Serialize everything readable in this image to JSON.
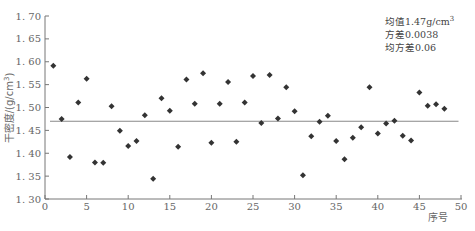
{
  "chart_data": {
    "type": "scatter",
    "title": "",
    "xlabel": "序号",
    "ylabel": "干密度/(g/cm³)",
    "xlim": [
      0,
      50
    ],
    "ylim": [
      1.3,
      1.7
    ],
    "x_ticks": [
      "0",
      "5",
      "10",
      "15",
      "20",
      "25",
      "30",
      "35",
      "40",
      "45",
      "50"
    ],
    "y_ticks": [
      "1.30",
      "1.35",
      "1.40",
      "1.45",
      "1.50",
      "1.55",
      "1.60",
      "1.65",
      "1.70"
    ],
    "grid": false,
    "marker": "diamond",
    "marker_color": "#333333",
    "mean_line": {
      "value": 1.47,
      "x_start": 0.6,
      "x_end": 49.7,
      "color": "#888888"
    },
    "annotations": [
      "均值1.47g/cm³",
      "方差0.0038",
      "均方差0.06"
    ],
    "series": [
      {
        "name": "干密度",
        "x": [
          1,
          2,
          3,
          4,
          5,
          6,
          7,
          8,
          9,
          10,
          11,
          12,
          13,
          14,
          15,
          16,
          17,
          18,
          19,
          20,
          21,
          22,
          23,
          24,
          25,
          26,
          27,
          28,
          29,
          30,
          31,
          32,
          33,
          34,
          35,
          36,
          37,
          38,
          39,
          40,
          41,
          42,
          43,
          44,
          45,
          46,
          47,
          48
        ],
        "values": [
          1.591,
          1.475,
          1.392,
          1.511,
          1.563,
          1.38,
          1.379,
          1.503,
          1.449,
          1.416,
          1.427,
          1.483,
          1.344,
          1.52,
          1.493,
          1.414,
          1.561,
          1.508,
          1.575,
          1.423,
          1.508,
          1.556,
          1.425,
          1.511,
          1.569,
          1.466,
          1.571,
          1.476,
          1.544,
          1.492,
          1.352,
          1.437,
          1.469,
          1.482,
          1.427,
          1.387,
          1.434,
          1.457,
          1.544,
          1.443,
          1.465,
          1.471,
          1.438,
          1.428,
          1.533,
          1.504,
          1.507,
          1.497
        ]
      }
    ]
  },
  "stats": {
    "mean_prefix": "均值1.47g/cm",
    "mean_sup": "3",
    "variance": "方差0.0038",
    "std": "均方差0.06"
  },
  "axes": {
    "ylabel_main": "干密度/(g/cm",
    "ylabel_sup": "3",
    "ylabel_close": ")",
    "xlabel": "序号"
  }
}
